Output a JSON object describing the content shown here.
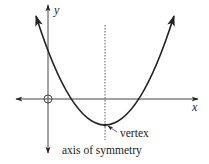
{
  "diagram": {
    "axes": {
      "x_label": "x",
      "y_label": "y"
    },
    "origin_marker": "circle",
    "curve": {
      "type": "parabola",
      "opens": "up",
      "vertex_px": [
        105,
        125
      ],
      "x_intercepts_px": [
        70,
        136
      ],
      "y_intercept_px": [
        48,
        48
      ]
    },
    "annotations": {
      "vertex_label": "vertex",
      "axis_label": "axis of symmetry"
    },
    "colors": {
      "line": "#222222",
      "background": "#ffffff"
    }
  }
}
